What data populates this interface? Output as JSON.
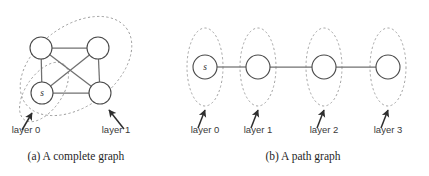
{
  "figure": {
    "width": 429,
    "height": 176,
    "background": "#ffffff",
    "ink_color": "#4a4a4a",
    "edge_color": "#707070",
    "dashed_color": "#9a9a9a",
    "arrow_color": "#2e2e2e"
  },
  "panel_a": {
    "caption": "(a)  A complete graph",
    "caption_x": 76,
    "caption_y": 160,
    "nodes": [
      {
        "id": "n-tl",
        "label": "",
        "cx": 41,
        "cy": 48,
        "r": 11
      },
      {
        "id": "n-tr",
        "label": "",
        "cx": 98,
        "cy": 48,
        "r": 11
      },
      {
        "id": "n-s",
        "label": "s",
        "cx": 42,
        "cy": 93,
        "r": 11
      },
      {
        "id": "n-br",
        "label": "",
        "cx": 100,
        "cy": 93,
        "r": 11
      }
    ],
    "edges": [
      {
        "from": "n-tl",
        "to": "n-tr"
      },
      {
        "from": "n-tl",
        "to": "n-s"
      },
      {
        "from": "n-tl",
        "to": "n-br"
      },
      {
        "from": "n-tr",
        "to": "n-s"
      },
      {
        "from": "n-tr",
        "to": "n-br"
      },
      {
        "from": "n-s",
        "to": "n-br"
      }
    ],
    "layers": [
      {
        "id": "layer0",
        "label": "layer 0",
        "label_x": 26,
        "label_y": 133,
        "ellipse": {
          "cx": 44,
          "cy": 92,
          "rx": 34,
          "ry": 18,
          "rotate": -55
        },
        "arrow": {
          "x1": 22,
          "y1": 130,
          "x2": 32,
          "y2": 113
        }
      },
      {
        "id": "layer1",
        "label": "layer 1",
        "label_x": 116,
        "label_y": 133,
        "ellipse": {
          "cx": 76,
          "cy": 66,
          "rx": 63,
          "ry": 40,
          "rotate": -37
        },
        "arrow": {
          "x1": 124,
          "y1": 129,
          "x2": 109,
          "y2": 110
        }
      }
    ]
  },
  "panel_b": {
    "caption": "(b)  A path graph",
    "caption_x": 303,
    "caption_y": 160,
    "nodes": [
      {
        "id": "p0",
        "label": "s",
        "cx": 205,
        "cy": 67,
        "r": 12
      },
      {
        "id": "p1",
        "label": "",
        "cx": 258,
        "cy": 67,
        "r": 12
      },
      {
        "id": "p2",
        "label": "",
        "cx": 324,
        "cy": 67,
        "r": 12
      },
      {
        "id": "p3",
        "label": "",
        "cx": 388,
        "cy": 67,
        "r": 12
      }
    ],
    "edges": [
      {
        "from": "p0",
        "to": "p1"
      },
      {
        "from": "p1",
        "to": "p2"
      },
      {
        "from": "p2",
        "to": "p3"
      }
    ],
    "layers": [
      {
        "id": "layer0",
        "label": "layer 0",
        "label_x": 205,
        "label_y": 133,
        "ellipse": {
          "cx": 205,
          "cy": 67,
          "rx": 18,
          "ry": 39,
          "rotate": 0
        },
        "arrow": {
          "x1": 198,
          "y1": 128,
          "x2": 205,
          "y2": 110
        }
      },
      {
        "id": "layer1",
        "label": "layer 1",
        "label_x": 258,
        "label_y": 133,
        "ellipse": {
          "cx": 258,
          "cy": 67,
          "rx": 18,
          "ry": 39,
          "rotate": 0
        },
        "arrow": {
          "x1": 251,
          "y1": 128,
          "x2": 258,
          "y2": 110
        }
      },
      {
        "id": "layer2",
        "label": "layer 2",
        "label_x": 324,
        "label_y": 133,
        "ellipse": {
          "cx": 324,
          "cy": 67,
          "rx": 18,
          "ry": 39,
          "rotate": 0
        },
        "arrow": {
          "x1": 317,
          "y1": 128,
          "x2": 324,
          "y2": 110
        }
      },
      {
        "id": "layer3",
        "label": "layer 3",
        "label_x": 388,
        "label_y": 133,
        "ellipse": {
          "cx": 388,
          "cy": 67,
          "rx": 18,
          "ry": 39,
          "rotate": 0
        },
        "arrow": {
          "x1": 381,
          "y1": 128,
          "x2": 388,
          "y2": 110
        }
      }
    ]
  }
}
